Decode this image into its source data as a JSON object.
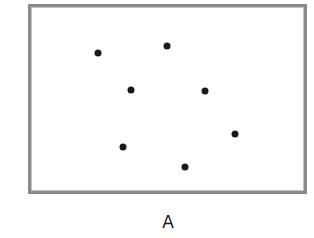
{
  "figure": {
    "label": "A",
    "frame_color": "#8a8a8a",
    "dot_color": "#1a1a1a",
    "dots": [
      {
        "x": 98,
        "y": 53
      },
      {
        "x": 167,
        "y": 46
      },
      {
        "x": 131,
        "y": 90
      },
      {
        "x": 205,
        "y": 91
      },
      {
        "x": 235,
        "y": 134
      },
      {
        "x": 123,
        "y": 147
      },
      {
        "x": 185,
        "y": 167
      }
    ]
  }
}
